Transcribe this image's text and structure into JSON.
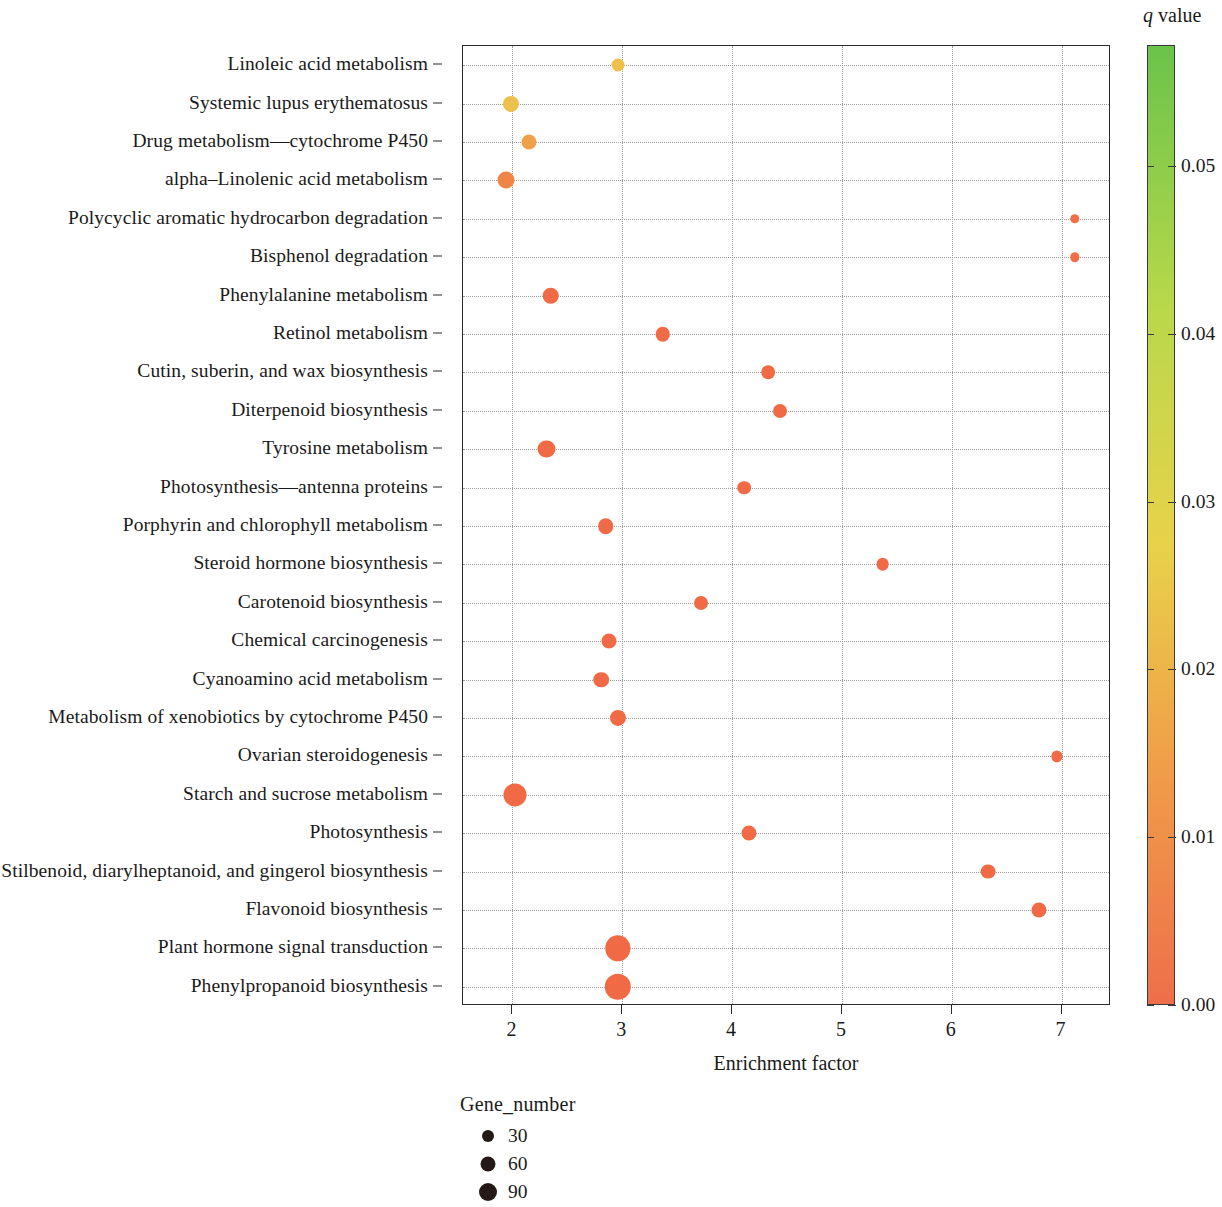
{
  "chart_data": {
    "type": "scatter",
    "title": "",
    "xlabel": "Enrichment factor",
    "ylabel": "",
    "xlim": [
      1.55,
      7.45
    ],
    "ylim": [
      0,
      25
    ],
    "xticks": [
      "2",
      "3",
      "4",
      "5",
      "6",
      "7"
    ],
    "xtick_values": [
      2,
      3,
      4,
      5,
      6,
      7
    ],
    "grid": "dotted",
    "categories": [
      "Linoleic acid metabolism",
      "Systemic lupus erythematosus",
      "Drug metabolism—cytochrome P450",
      "alpha–Linolenic acid metabolism",
      "Polycyclic aromatic hydrocarbon degradation",
      "Bisphenol degradation",
      "Phenylalanine metabolism",
      "Retinol metabolism",
      "Cutin, suberin, and wax biosynthesis",
      "Diterpenoid biosynthesis",
      "Tyrosine metabolism",
      "Photosynthesis—antenna proteins",
      "Porphyrin and chlorophyll metabolism",
      "Steroid hormone biosynthesis",
      "Carotenoid biosynthesis",
      "Chemical carcinogenesis",
      "Cyanoamino acid metabolism",
      "Metabolism of xenobiotics by cytochrome P450",
      "Ovarian steroidogenesis",
      "Starch and sucrose metabolism",
      "Photosynthesis",
      "Stilbenoid, diarylheptanoid, and gingerol biosynthesis",
      "Flavonoid biosynthesis",
      "Plant hormone signal transduction",
      "Phenylpropanoid biosynthesis"
    ],
    "points": [
      {
        "pathway": "Linoleic acid metabolism",
        "enrichment_factor": 2.96,
        "q_value": 0.0245,
        "gene_number": 14,
        "color": "#eec04a"
      },
      {
        "pathway": "Systemic lupus erythematosus",
        "enrichment_factor": 1.99,
        "q_value": 0.023,
        "gene_number": 25,
        "color": "#edc14b"
      },
      {
        "pathway": "Drug metabolism—cytochrome P450",
        "enrichment_factor": 2.15,
        "q_value": 0.0175,
        "gene_number": 21,
        "color": "#f0a048"
      },
      {
        "pathway": "alpha–Linolenic acid metabolism",
        "enrichment_factor": 1.94,
        "q_value": 0.0135,
        "gene_number": 29,
        "color": "#f08548"
      },
      {
        "pathway": "Polycyclic aromatic hydrocarbon degradation",
        "enrichment_factor": 7.12,
        "q_value": 0.0035,
        "gene_number": 5,
        "color": "#ef6e47"
      },
      {
        "pathway": "Bisphenol degradation",
        "enrichment_factor": 7.12,
        "q_value": 0.0035,
        "gene_number": 5,
        "color": "#ef6e47"
      },
      {
        "pathway": "Phenylalanine metabolism",
        "enrichment_factor": 2.35,
        "q_value": 0.003,
        "gene_number": 27,
        "color": "#f06a46"
      },
      {
        "pathway": "Retinol metabolism",
        "enrichment_factor": 3.37,
        "q_value": 0.0028,
        "gene_number": 19,
        "color": "#f06a46"
      },
      {
        "pathway": "Cutin, suberin, and wax biosynthesis",
        "enrichment_factor": 4.33,
        "q_value": 0.0025,
        "gene_number": 16,
        "color": "#f06a46"
      },
      {
        "pathway": "Diterpenoid biosynthesis",
        "enrichment_factor": 4.44,
        "q_value": 0.0025,
        "gene_number": 17,
        "color": "#f06a46"
      },
      {
        "pathway": "Tyrosine metabolism",
        "enrichment_factor": 2.31,
        "q_value": 0.0022,
        "gene_number": 29,
        "color": "#f06a46"
      },
      {
        "pathway": "Photosynthesis—antenna proteins",
        "enrichment_factor": 4.11,
        "q_value": 0.002,
        "gene_number": 16,
        "color": "#f06a46"
      },
      {
        "pathway": "Porphyrin and chlorophyll metabolism",
        "enrichment_factor": 2.85,
        "q_value": 0.0018,
        "gene_number": 23,
        "color": "#f06a46"
      },
      {
        "pathway": "Steroid hormone biosynthesis",
        "enrichment_factor": 5.37,
        "q_value": 0.0015,
        "gene_number": 13,
        "color": "#f06a46"
      },
      {
        "pathway": "Carotenoid biosynthesis",
        "enrichment_factor": 3.72,
        "q_value": 0.0013,
        "gene_number": 17,
        "color": "#f06a46"
      },
      {
        "pathway": "Chemical carcinogenesis",
        "enrichment_factor": 2.88,
        "q_value": 0.0012,
        "gene_number": 21,
        "color": "#f06a46"
      },
      {
        "pathway": "Cyanoamino acid metabolism",
        "enrichment_factor": 2.81,
        "q_value": 0.001,
        "gene_number": 23,
        "color": "#f06a46"
      },
      {
        "pathway": "Metabolism of xenobiotics by cytochrome P450",
        "enrichment_factor": 2.96,
        "q_value": 0.0009,
        "gene_number": 25,
        "color": "#f06a46"
      },
      {
        "pathway": "Ovarian steroidogenesis",
        "enrichment_factor": 6.96,
        "q_value": 0.0008,
        "gene_number": 9,
        "color": "#f06a46"
      },
      {
        "pathway": "Starch and sucrose metabolism",
        "enrichment_factor": 2.02,
        "q_value": 0.0006,
        "gene_number": 62,
        "color": "#f06a46"
      },
      {
        "pathway": "Photosynthesis",
        "enrichment_factor": 4.15,
        "q_value": 0.0005,
        "gene_number": 21,
        "color": "#f06a46"
      },
      {
        "pathway": "Stilbenoid, diarylheptanoid, and gingerol biosynthesis",
        "enrichment_factor": 6.33,
        "q_value": 0.0004,
        "gene_number": 20,
        "color": "#f06a46"
      },
      {
        "pathway": "Flavonoid biosynthesis",
        "enrichment_factor": 6.79,
        "q_value": 0.0003,
        "gene_number": 21,
        "color": "#f06a46"
      },
      {
        "pathway": "Plant hormone signal transduction",
        "enrichment_factor": 2.96,
        "q_value": 0.0002,
        "gene_number": 78,
        "color": "#f06a46"
      },
      {
        "pathway": "Phenylpropanoid biosynthesis",
        "enrichment_factor": 2.96,
        "q_value": 0.0001,
        "gene_number": 86,
        "color": "#f06a46"
      }
    ]
  },
  "colorbar": {
    "title_q": "q",
    "title_rest": " value",
    "ticks": [
      "0.05",
      "0.04",
      "0.03",
      "0.02",
      "0.01",
      "0.00"
    ],
    "tick_values": [
      0.05,
      0.04,
      0.03,
      0.02,
      0.01,
      0.0
    ],
    "range": [
      0.0,
      0.0572
    ],
    "color_low": "#ee6f4a",
    "color_mid_low": "#f0a048",
    "color_mid": "#e8d24a",
    "color_mid_high": "#b8d84a",
    "color_high": "#6ac34a"
  },
  "size_legend": {
    "title": "Gene_number",
    "items": [
      {
        "label": "30",
        "diameter_px": 12
      },
      {
        "label": "60",
        "diameter_px": 15
      },
      {
        "label": "90",
        "diameter_px": 18
      }
    ],
    "dot_color": "#231a18"
  }
}
